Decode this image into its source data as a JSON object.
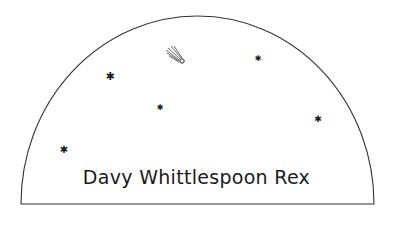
{
  "caption": "Davy Whittlespoon Rex",
  "colors": {
    "line": "#333333",
    "ink": "#1a1a1a",
    "background": "#ffffff"
  },
  "stars": [
    {
      "x": 110,
      "y": 76,
      "size": 11,
      "glyph": "✱"
    },
    {
      "x": 160,
      "y": 108,
      "size": 8,
      "glyph": "✱"
    },
    {
      "x": 258,
      "y": 59,
      "size": 8,
      "glyph": "✱"
    },
    {
      "x": 318,
      "y": 119,
      "size": 9,
      "glyph": "✱"
    },
    {
      "x": 64,
      "y": 150,
      "size": 10,
      "glyph": "✱"
    }
  ],
  "comet": {
    "x": 182,
    "y": 61
  }
}
